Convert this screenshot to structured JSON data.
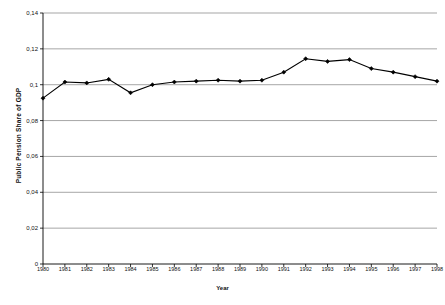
{
  "chart_data": {
    "type": "line",
    "title": "",
    "xlabel": "Year",
    "ylabel": "Public Pension Share of GDP",
    "xlim": [
      1980,
      1998
    ],
    "ylim": [
      0,
      0.14
    ],
    "grid": true,
    "legend": "none",
    "marker": "diamond",
    "line_color": "#000000",
    "grid_color": "#808080",
    "axis_color": "#000000",
    "ytick_labels": [
      "0",
      "0,02",
      "0,04",
      "0,06",
      "0,08",
      "0,1",
      "0,12",
      "0,14"
    ],
    "ytick_values": [
      0,
      0.02,
      0.04,
      0.06,
      0.08,
      0.1,
      0.12,
      0.14
    ],
    "categories": [
      1980,
      1981,
      1982,
      1983,
      1984,
      1985,
      1986,
      1987,
      1988,
      1989,
      1990,
      1991,
      1992,
      1993,
      1994,
      1995,
      1996,
      1997,
      1998
    ],
    "xtick_labels": [
      "1980",
      "1981",
      "1982",
      "1983",
      "1984",
      "1985",
      "1986",
      "1987",
      "1988",
      "1989",
      "1990",
      "1991",
      "1992",
      "1993",
      "1994",
      "1995",
      "1996",
      "1997",
      "1998"
    ],
    "values": [
      0.0925,
      0.1015,
      0.101,
      0.103,
      0.0955,
      0.1,
      0.1015,
      0.102,
      0.1025,
      0.102,
      0.1025,
      0.107,
      0.1145,
      0.113,
      0.114,
      0.109,
      0.107,
      0.1045,
      0.102
    ],
    "series": [
      {
        "name": "Public Pension Share of GDP",
        "values": [
          0.0925,
          0.1015,
          0.101,
          0.103,
          0.0955,
          0.1,
          0.1015,
          0.102,
          0.1025,
          0.102,
          0.1025,
          0.107,
          0.1145,
          0.113,
          0.114,
          0.109,
          0.107,
          0.1045,
          0.102
        ]
      }
    ]
  }
}
